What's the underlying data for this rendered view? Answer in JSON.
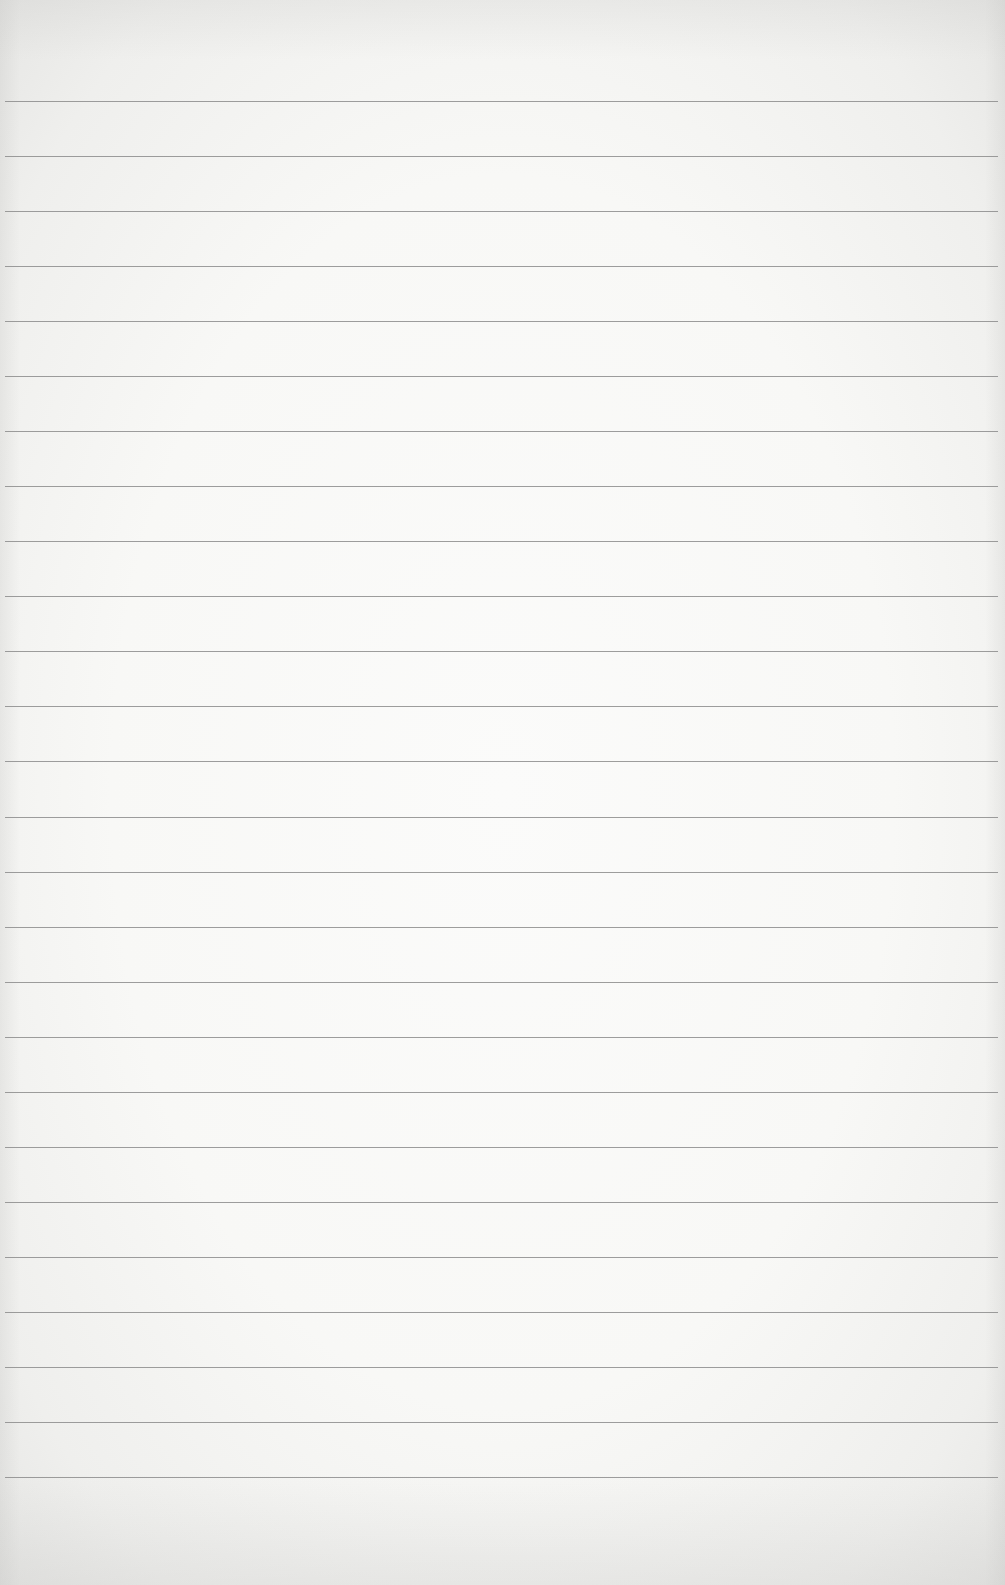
{
  "paper": {
    "description": "blank ruled notebook paper",
    "background_color": "#f8f8f6",
    "edge_color": "#e6e6e4",
    "rule_color": "#8c8c8c",
    "rule_count": 26,
    "first_rule_y": 101,
    "rule_spacing": 55.04,
    "rule_left": 5,
    "rule_right": 998
  }
}
